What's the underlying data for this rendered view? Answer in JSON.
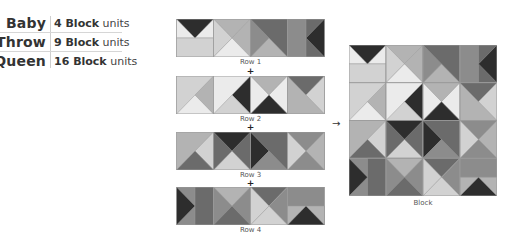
{
  "sizes": [
    {
      "label": "Baby",
      "count": "4 Block",
      "unit": "units"
    },
    {
      "label": "Throw",
      "count": "9 Block",
      "unit": "units"
    },
    {
      "label": "Queen",
      "count": "16 Block",
      "unit": "units"
    }
  ],
  "rows": [
    {
      "label": "Row 1"
    },
    {
      "label": "Row 2"
    },
    {
      "label": "Row 3"
    },
    {
      "label": "Row 4"
    }
  ],
  "plus_symbol": "+",
  "arrow_symbol": "→",
  "block_label": "Block",
  "colors": {
    "dark": "#2d2d2d",
    "darkmid": "#6b6b6b",
    "mid": "#8c8c8c",
    "light": "#b3b3b3",
    "lighter": "#d2d2d2",
    "white": "#ebebeb",
    "line": "#9a9a9a"
  }
}
